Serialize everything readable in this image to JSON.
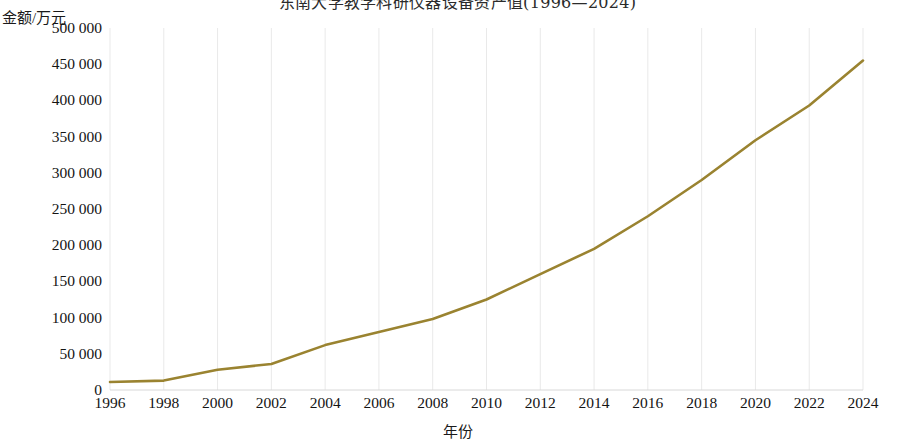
{
  "chart_data": {
    "type": "line",
    "title": "东南大学教学科研仪器设备资产值(1996—2024)",
    "xlabel": "年份",
    "ylabel": "金额/万元",
    "grid": true,
    "legend": "none",
    "line_color": "#9a8330",
    "xlim": [
      1996,
      2024
    ],
    "ylim": [
      0,
      500000
    ],
    "x_tick_labels": [
      "1996",
      "1998",
      "2000",
      "2002",
      "2004",
      "2006",
      "2008",
      "2010",
      "2012",
      "2014",
      "2016",
      "2018",
      "2020",
      "2022",
      "2024"
    ],
    "x_ticks": [
      1996,
      1998,
      2000,
      2002,
      2004,
      2006,
      2008,
      2010,
      2012,
      2014,
      2016,
      2018,
      2020,
      2022,
      2024
    ],
    "y_tick_labels": [
      "0",
      "50 000",
      "100 000",
      "150 000",
      "200 000",
      "250 000",
      "300 000",
      "350 000",
      "400 000",
      "450 000",
      "500 000"
    ],
    "y_ticks": [
      0,
      50000,
      100000,
      150000,
      200000,
      250000,
      300000,
      350000,
      400000,
      450000,
      500000
    ],
    "x": [
      1996,
      1998,
      2000,
      2002,
      2004,
      2006,
      2008,
      2010,
      2012,
      2014,
      2016,
      2018,
      2020,
      2022,
      2024
    ],
    "values": [
      11000,
      13000,
      28000,
      36000,
      62000,
      80000,
      98000,
      125000,
      160000,
      195000,
      240000,
      290000,
      345000,
      393000,
      455000
    ],
    "series": [
      {
        "name": "教学科研仪器设备资产值",
        "values": [
          11000,
          13000,
          28000,
          36000,
          62000,
          80000,
          98000,
          125000,
          160000,
          195000,
          240000,
          290000,
          345000,
          393000,
          455000
        ]
      }
    ]
  }
}
